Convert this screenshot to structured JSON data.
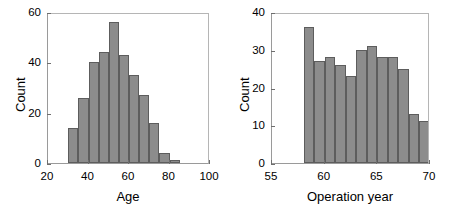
{
  "figure": {
    "width": 449,
    "height": 217,
    "background": "#ffffff",
    "bar_fill": "#8c8c8c",
    "bar_edge": "#5d5d5d",
    "axis_color": "#9a9a9a"
  },
  "chart_data": [
    {
      "type": "bar",
      "id": "age-histogram",
      "title": "",
      "xlabel": "Age",
      "ylabel": "Count",
      "xlim": [
        20,
        100
      ],
      "ylim": [
        0,
        60
      ],
      "xticks": [
        20,
        40,
        60,
        80,
        100
      ],
      "xticklabels": [
        "20",
        "40",
        "60",
        "80",
        "100"
      ],
      "yticks": [
        0,
        20,
        40,
        60
      ],
      "yticklabels": [
        "0",
        "20",
        "40",
        "60"
      ],
      "grid": false,
      "legend": null,
      "bin_edges": [
        30,
        35,
        40,
        45,
        50,
        55,
        60,
        65,
        70,
        75,
        80,
        85
      ],
      "categories": [
        "30-35",
        "35-40",
        "40-45",
        "45-50",
        "50-55",
        "55-60",
        "60-65",
        "65-70",
        "70-75",
        "75-80",
        "80-85"
      ],
      "values": [
        14,
        26,
        40,
        44,
        56,
        43,
        35,
        27,
        16,
        4,
        1
      ]
    },
    {
      "type": "bar",
      "id": "operation-year-histogram",
      "title": "",
      "xlabel": "Operation year",
      "ylabel": "Count",
      "xlim": [
        55,
        70
      ],
      "ylim": [
        0,
        40
      ],
      "xticks": [
        55,
        60,
        65,
        70
      ],
      "xticklabels": [
        "55",
        "60",
        "65",
        "70"
      ],
      "yticks": [
        0,
        10,
        20,
        30,
        40
      ],
      "yticklabels": [
        "0",
        "10",
        "20",
        "30",
        "40"
      ],
      "grid": false,
      "legend": null,
      "bin_edges": [
        58,
        59,
        60,
        61,
        62,
        63,
        64,
        65,
        66,
        67,
        68,
        69,
        70
      ],
      "categories": [
        "58",
        "59",
        "60",
        "61",
        "62",
        "63",
        "64",
        "65",
        "66",
        "67",
        "68",
        "69"
      ],
      "values": [
        36,
        27,
        28,
        26,
        23,
        30,
        31,
        28,
        28,
        25,
        13,
        11
      ]
    }
  ]
}
